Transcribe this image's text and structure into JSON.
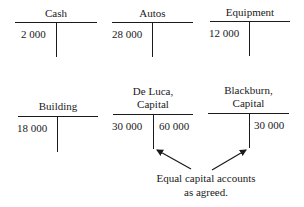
{
  "accounts": [
    {
      "name": "Cash",
      "debit": "2 000",
      "credit": ""
    },
    {
      "name": "Autos",
      "debit": "28 000",
      "credit": ""
    },
    {
      "name": "Equipment",
      "debit": "12 000",
      "credit": ""
    },
    {
      "name": "Building",
      "debit": "18 000",
      "credit": ""
    },
    {
      "name_line1": "De Luca,",
      "name_line2": "Capital",
      "debit": "30 000",
      "credit": "60 000"
    },
    {
      "name_line1": "Blackburn,",
      "name_line2": "Capital",
      "debit": "",
      "credit": "30 000"
    }
  ],
  "annotation": {
    "line1": "Equal capital accounts",
    "line2": "as agreed."
  },
  "colors": {
    "ink": "#1a1a1a",
    "background": "#ffffff"
  }
}
